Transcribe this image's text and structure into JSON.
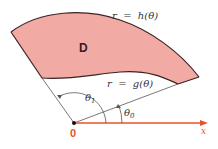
{
  "diagram": {
    "region_label": "D",
    "outer_curve_label": "r  =  h(θ)",
    "inner_curve_label": "r  =  g(θ)",
    "angle_outer_label": "θ",
    "angle_outer_sub": "1",
    "angle_inner_label": "θ",
    "angle_inner_sub": "0",
    "origin_label": "0",
    "axis_label": "x",
    "colors": {
      "region_fill": "#f2aba4",
      "curve_stroke": "#3a2222",
      "axis": "#e8532a",
      "ray": "#555555"
    }
  }
}
